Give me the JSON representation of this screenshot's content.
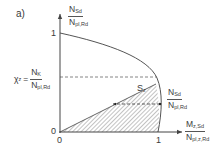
{
  "figure": {
    "panel_label": "a)",
    "y_axis": {
      "label_num": "N",
      "label_num_sub": "Sd",
      "label_den": "N",
      "label_den_sub": "pl,Rd",
      "tick_one": "1",
      "tick_zero": "0"
    },
    "x_axis": {
      "label_num": "M",
      "label_num_sub": "z,Sd",
      "label_den": "N",
      "label_den_sub": "pl,z,Rd",
      "tick_one": "1",
      "tick_zero": "0"
    },
    "chi_label": {
      "lhs": "χ",
      "lhs_sub": "z",
      "equals": "=",
      "num": "N",
      "num_sub": "K",
      "den": "N",
      "den_sub": "pl,Rd"
    },
    "region_label": {
      "text": "S",
      "sub": "z"
    },
    "point_label": {
      "num": "N",
      "num_sub": "Sd",
      "den": "N",
      "den_sub": "pl,Rd"
    },
    "colors": {
      "line": "#555555",
      "hatch": "#777777",
      "text": "#3a3a3a"
    }
  }
}
